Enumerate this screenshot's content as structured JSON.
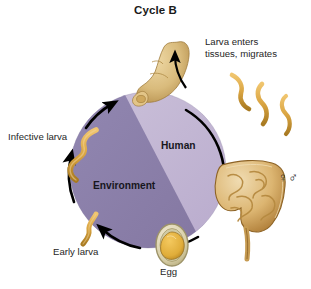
{
  "title": "Cycle B",
  "diagram": {
    "type": "life-cycle",
    "regions": [
      {
        "id": "human",
        "label": "Human",
        "color": "#c3b7d4"
      },
      {
        "id": "environment",
        "label": "Environment",
        "color": "#8b7fad"
      }
    ],
    "stages": [
      {
        "id": "larva-enters",
        "label": "Larva enters\ntissues, migrates",
        "line1": "Larva enters",
        "line2": "tissues, migrates"
      },
      {
        "id": "infective-larva",
        "label": "Infective larva"
      },
      {
        "id": "early-larva",
        "label": "Early larva"
      },
      {
        "id": "egg",
        "label": "Egg"
      }
    ],
    "organisms": [
      {
        "id": "foot",
        "name": "foot-illustration"
      },
      {
        "id": "intestine",
        "name": "intestine-illustration"
      },
      {
        "id": "egg-oval",
        "name": "egg-illustration"
      },
      {
        "id": "larva-left",
        "name": "larva-illustration"
      },
      {
        "id": "larva-bottom",
        "name": "larva-illustration"
      },
      {
        "id": "larva-outer-1",
        "name": "larva-illustration"
      },
      {
        "id": "larva-outer-2",
        "name": "larva-illustration"
      }
    ],
    "sex_symbols": "♀♂",
    "arrow_color": "#000000",
    "larva_color": "#d9a441",
    "flesh_color": "#d8b46a"
  }
}
